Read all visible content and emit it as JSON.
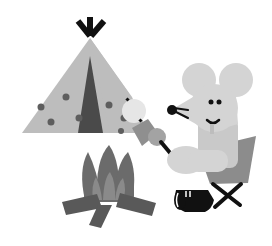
{
  "illustration": {
    "subject": "mouse roasting marshmallows by a campfire next to a tent",
    "elements": [
      "tent",
      "campfire",
      "mouse",
      "camp-chair",
      "marshmallow-stick"
    ],
    "colors": {
      "background": "#ffffff",
      "tent": "#bdbdbd",
      "tent_door": "#4a4a4a",
      "tent_dots": "#5e5e5e",
      "tent_poles": "#111111",
      "mouse_body": "#d4d4d4",
      "mouse_features": "#111111",
      "chair_seat": "#8c8c8c",
      "chair_legs": "#111111",
      "shoe": "#111111",
      "fire_outer": "#6b6b6b",
      "fire_inner": "#8a8a8a",
      "logs": "#595959",
      "marshmallow_light": "#e6e6e6",
      "marshmallow_toasted": "#8f8f8f",
      "marshmallow_mid": "#a3a3a3",
      "stick": "#111111"
    }
  }
}
